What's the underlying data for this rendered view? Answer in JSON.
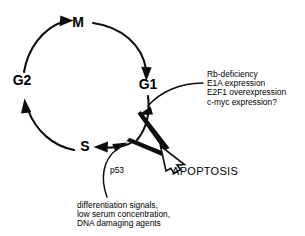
{
  "diagram": {
    "title_present": false,
    "type": "cell-cycle-apoptosis-schematic",
    "background_color": "#ffffff",
    "line_color": "#0d0d0d",
    "phases": [
      {
        "id": "M",
        "label": "M",
        "x": 78,
        "y": 27
      },
      {
        "id": "G1",
        "label": "G1",
        "x": 148,
        "y": 89
      },
      {
        "id": "S",
        "label": "S",
        "x": 85,
        "y": 151
      },
      {
        "id": "G2",
        "label": "G2",
        "x": 22,
        "y": 85
      }
    ],
    "cycle_order": [
      "M",
      "G1",
      "S",
      "G2"
    ],
    "apoptosis": {
      "label": "APOPTOSIS",
      "x": 172,
      "y": 175
    },
    "p53": {
      "label": "p53",
      "x": 110,
      "y": 173
    },
    "oncogenic_signals": {
      "lines": [
        "Rb-deficiency",
        "E1A expression",
        "E2F1 overexpression",
        "c-myc expression?"
      ],
      "x": 207,
      "y_start": 77,
      "line_height": 9.2
    },
    "stress_signals": {
      "lines": [
        "differentiation signals,",
        "low serum concentration,",
        "DNA damaging agents"
      ],
      "x": 77,
      "y_start": 208,
      "line_height": 9.2
    }
  }
}
